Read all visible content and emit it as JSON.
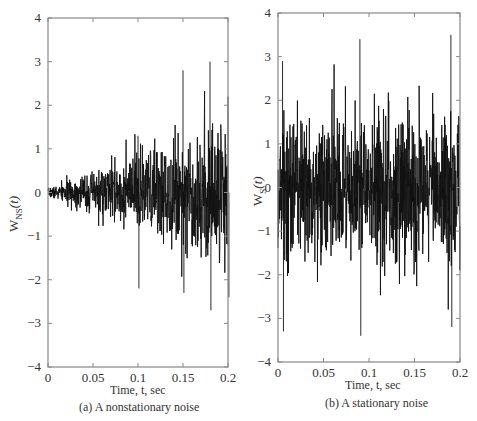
{
  "chart_data": [
    {
      "type": "line",
      "panel": "a",
      "caption": "(a) A nonstationary noise",
      "xlabel": "Time, t, sec",
      "ylabel_main": "W",
      "ylabel_sub": "NS",
      "ylabel_arg": "(t)",
      "xlim": [
        0,
        0.2
      ],
      "ylim": [
        -4,
        4
      ],
      "xticks": [
        0,
        0.05,
        0.1,
        0.15,
        0.2
      ],
      "xtick_labels": [
        "0",
        "0.05",
        "0.1",
        "0.15",
        "0.2"
      ],
      "yticks": [
        -4,
        -3,
        -2,
        -1,
        0,
        1,
        2,
        3,
        4
      ],
      "ytick_labels": [
        "−4",
        "−3",
        "−2",
        "−1",
        "0",
        "1",
        "2",
        "3",
        "4"
      ],
      "grid": false,
      "description": "Noise whose amplitude envelope grows linearly with time from 0 at t=0 to about ±2.5 at t=0.2",
      "envelope": {
        "start": 0.05,
        "end": 1.0,
        "growth": "linear"
      },
      "peaks": [
        {
          "t": 0.1,
          "max": 1.3,
          "min": -2.2
        },
        {
          "t": 0.15,
          "max": 2.8,
          "min": -2.3
        },
        {
          "t": 0.18,
          "max": 3.0,
          "min": -2.7
        },
        {
          "t": 0.2,
          "max": 2.2,
          "min": -2.4
        }
      ],
      "seed": 7,
      "n_points": 900
    },
    {
      "type": "line",
      "panel": "b",
      "caption": "(b) A stationary noise",
      "xlabel": "Time, t, sec",
      "ylabel_main": "W",
      "ylabel_sub": "S",
      "ylabel_arg": "(t)",
      "xlim": [
        0,
        0.2
      ],
      "ylim": [
        -4,
        4
      ],
      "xticks": [
        0,
        0.05,
        0.1,
        0.15,
        0.2
      ],
      "xtick_labels": [
        "0",
        "0.05",
        "0.1",
        "0.15",
        "0.2"
      ],
      "yticks": [
        -4,
        -3,
        -2,
        -1,
        0,
        1,
        2,
        3,
        4
      ],
      "ytick_labels": [
        "−4",
        "−3",
        "−2",
        "−1",
        "0",
        "1",
        "2",
        "3",
        "4"
      ],
      "grid": false,
      "description": "Stationary noise with roughly constant amplitude, peaks about ±3.5",
      "envelope": {
        "start": 1.0,
        "end": 1.0,
        "growth": "constant"
      },
      "peaks": [
        {
          "t": 0.09,
          "max": 3.4,
          "min": -3.4
        },
        {
          "t": 0.19,
          "max": 3.5,
          "min": -3.2
        },
        {
          "t": 0.005,
          "max": 2.9,
          "min": -3.3
        }
      ],
      "seed": 13,
      "n_points": 900
    }
  ],
  "colors": {
    "axis": "#888888",
    "signal": "#111111"
  }
}
